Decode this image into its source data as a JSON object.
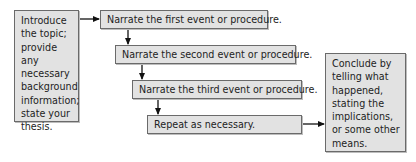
{
  "diagram": {
    "intro_box": {
      "text": "Introduce the topic; provide any necessary background information; state your thesis."
    },
    "steps": [
      {
        "text": "Narrate the first event or procedure."
      },
      {
        "text": "Narrate the second event or procedure."
      },
      {
        "text": "Narrate the third event or procedure."
      },
      {
        "text": "Repeat as necessary."
      }
    ],
    "conclusion_box": {
      "text": "Conclude by telling what happened, stating the implications, or some other means."
    },
    "colors": {
      "box_fill": "#e2e2e2",
      "box_border": "#6a6a6a",
      "arrow": "#111111"
    }
  }
}
